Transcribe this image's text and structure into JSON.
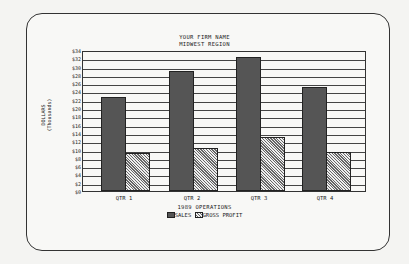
{
  "chart_data": {
    "type": "bar",
    "title": "YOUR FIRM NAME",
    "subtitle": "MIDWEST REGION",
    "xlabel": "1989 OPERATIONS",
    "ylabel": "DOLLARS",
    "ylabel_sub": "(Thousands)",
    "categories": [
      "QTR 1",
      "QTR 2",
      "QTR 3",
      "QTR 4"
    ],
    "series": [
      {
        "name": "SALES",
        "values": [
          22.6,
          28.9,
          32.2,
          25.1
        ]
      },
      {
        "name": "GROSS PROFIT",
        "values": [
          9.2,
          10.3,
          13.1,
          9.4
        ]
      }
    ],
    "ylim": [
      0,
      34
    ],
    "yticks": [
      "$0",
      "$2",
      "$4",
      "$6",
      "$8",
      "$10",
      "$12",
      "$14",
      "$16",
      "$18",
      "$20",
      "$22",
      "$24",
      "$26",
      "$28",
      "$30",
      "$32",
      "$34"
    ],
    "grid": true,
    "legend_position": "bottom"
  }
}
